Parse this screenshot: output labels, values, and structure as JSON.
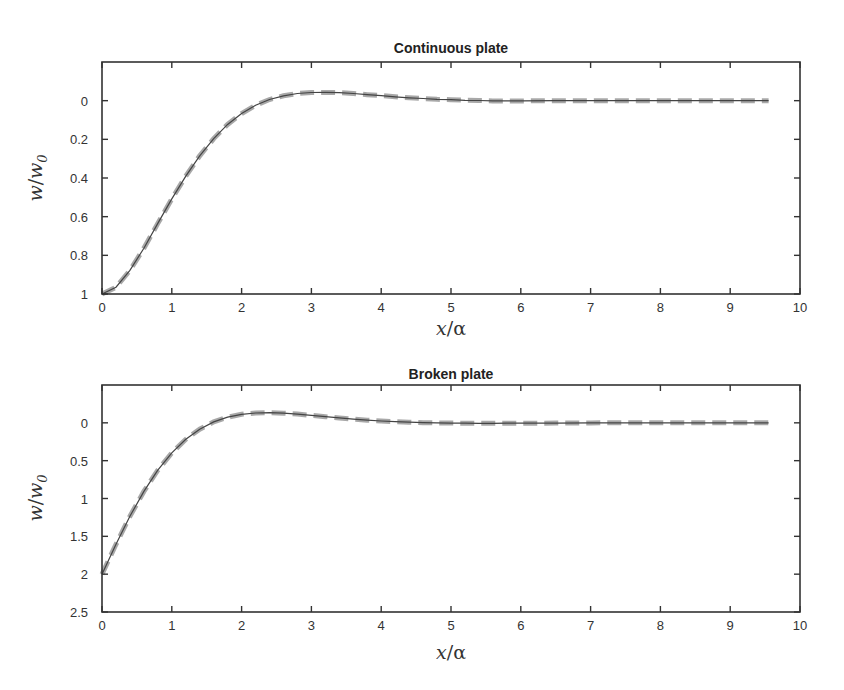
{
  "figure": {
    "panels": [
      {
        "title": "Continuous plate",
        "xlabel_main": "x",
        "xlabel_sym": "α",
        "ylabel_main": "w",
        "ylabel_den": "w",
        "ylabel_sub": "0",
        "xticks": [
          "0",
          "1",
          "2",
          "3",
          "4",
          "5",
          "6",
          "7",
          "8",
          "9",
          "10"
        ],
        "yticks": [
          "0",
          "0.2",
          "0.4",
          "0.6",
          "0.8",
          "1"
        ]
      },
      {
        "title": "Broken plate",
        "xlabel_main": "x",
        "xlabel_sym": "α",
        "ylabel_main": "w",
        "ylabel_den": "w",
        "ylabel_sub": "0",
        "xticks": [
          "0",
          "1",
          "2",
          "3",
          "4",
          "5",
          "6",
          "7",
          "8",
          "9",
          "10"
        ],
        "yticks": [
          "0",
          "0.5",
          "1",
          "1.5",
          "2",
          "2.5"
        ]
      }
    ]
  },
  "chart_data": [
    {
      "type": "line",
      "title": "Continuous plate",
      "xlabel": "x/α",
      "ylabel": "w/w0",
      "xlim": [
        0,
        10
      ],
      "ylim": [
        -0.2,
        1
      ],
      "y_inverted": true,
      "grid": false,
      "legend": null,
      "xticks": [
        0,
        1,
        2,
        3,
        4,
        5,
        6,
        7,
        8,
        9,
        10
      ],
      "yticks": [
        0,
        0.2,
        0.4,
        0.6,
        0.8,
        1
      ],
      "x": [
        0,
        0.2,
        0.4,
        0.6,
        0.8,
        1.0,
        1.2,
        1.4,
        1.6,
        1.8,
        2.0,
        2.2,
        2.4,
        2.6,
        2.8,
        3.0,
        3.2,
        3.4,
        3.6,
        3.8,
        4.0,
        4.2,
        4.4,
        4.6,
        4.8,
        5.0,
        5.2,
        5.4,
        5.6,
        5.8,
        6.0,
        6.5,
        7.0,
        7.5,
        8.0,
        8.5,
        9.0,
        9.55
      ],
      "series": [
        {
          "name": "solid (thin dark line)",
          "style": "solid",
          "color": "#444444",
          "values": [
            1,
            0.965,
            0.878,
            0.763,
            0.635,
            0.508,
            0.39,
            0.285,
            0.196,
            0.123,
            0.067,
            0.024,
            -0.006,
            -0.025,
            -0.037,
            -0.042,
            -0.043,
            -0.041,
            -0.037,
            -0.031,
            -0.026,
            -0.02,
            -0.015,
            -0.011,
            -0.007,
            -0.005,
            -0.002,
            -0.001,
            0.001,
            0.001,
            0.001,
            0,
            0,
            0,
            0,
            0,
            0,
            0
          ]
        },
        {
          "name": "dashed (thick grey line)",
          "style": "dashed",
          "color": "#999999",
          "values": [
            1,
            0.965,
            0.878,
            0.763,
            0.635,
            0.508,
            0.39,
            0.285,
            0.196,
            0.123,
            0.067,
            0.024,
            -0.006,
            -0.025,
            -0.037,
            -0.042,
            -0.043,
            -0.041,
            -0.037,
            -0.031,
            -0.026,
            -0.02,
            -0.015,
            -0.011,
            -0.007,
            -0.005,
            -0.002,
            -0.001,
            0.001,
            0.001,
            0.001,
            0,
            0,
            0,
            0,
            0,
            0,
            0
          ]
        }
      ]
    },
    {
      "type": "line",
      "title": "Broken plate",
      "xlabel": "x/α",
      "ylabel": "w/w0",
      "xlim": [
        0,
        10
      ],
      "ylim": [
        -0.5,
        2.5
      ],
      "y_inverted": true,
      "grid": false,
      "legend": null,
      "xticks": [
        0,
        1,
        2,
        3,
        4,
        5,
        6,
        7,
        8,
        9,
        10
      ],
      "yticks": [
        0,
        0.5,
        1,
        1.5,
        2,
        2.5
      ],
      "x": [
        0,
        0.2,
        0.4,
        0.6,
        0.8,
        1.0,
        1.2,
        1.4,
        1.6,
        1.8,
        2.0,
        2.2,
        2.4,
        2.6,
        2.8,
        3.0,
        3.2,
        3.4,
        3.6,
        3.8,
        4.0,
        4.2,
        4.4,
        4.6,
        4.8,
        5.0,
        5.2,
        5.4,
        5.6,
        5.8,
        6.0,
        6.5,
        7.0,
        7.5,
        8.0,
        8.5,
        9.0,
        9.55
      ],
      "series": [
        {
          "name": "solid (thin dark line)",
          "style": "solid",
          "color": "#444444",
          "values": [
            2,
            1.605,
            1.235,
            0.906,
            0.626,
            0.398,
            0.218,
            0.084,
            -0.012,
            -0.075,
            -0.113,
            -0.13,
            -0.134,
            -0.127,
            -0.115,
            -0.099,
            -0.081,
            -0.065,
            -0.049,
            -0.035,
            -0.024,
            -0.015,
            -0.008,
            -0.002,
            0.001,
            0.004,
            0.005,
            0.006,
            0.006,
            0.005,
            0.005,
            0.003,
            0.001,
            0,
            0,
            0,
            0,
            0
          ]
        },
        {
          "name": "dashed (thick grey line)",
          "style": "dashed",
          "color": "#999999",
          "values": [
            2,
            1.605,
            1.235,
            0.906,
            0.626,
            0.398,
            0.218,
            0.084,
            -0.012,
            -0.075,
            -0.113,
            -0.13,
            -0.134,
            -0.127,
            -0.115,
            -0.099,
            -0.081,
            -0.065,
            -0.049,
            -0.035,
            -0.024,
            -0.015,
            -0.008,
            -0.002,
            0.001,
            0.004,
            0.005,
            0.006,
            0.006,
            0.005,
            0.005,
            0.003,
            0.001,
            0,
            0,
            0,
            0,
            0
          ]
        }
      ]
    }
  ]
}
